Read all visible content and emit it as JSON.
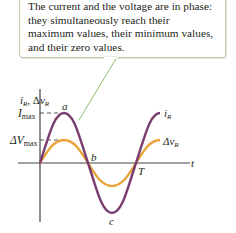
{
  "callout": {
    "lines": [
      "The current and the voltage are in phase:",
      "they simultaneously reach their",
      "maximum values, their minimum values,",
      "and their zero values."
    ]
  },
  "axes": {
    "y_label_i": "i",
    "y_label_i_sub": "R",
    "y_label_sep": ", Δ",
    "y_label_v": "v",
    "y_label_v_sub": "R",
    "x_label": "t"
  },
  "ticks": {
    "imax_main": "I",
    "imax_sub": "max",
    "vmax_main": "ΔV",
    "vmax_sub": "max"
  },
  "points": {
    "a": "a",
    "b": "b",
    "c": "c",
    "T": "T"
  },
  "legend": {
    "current_main": "i",
    "current_sub": "R",
    "voltage_main": "Δv",
    "voltage_sub": "R"
  },
  "colors": {
    "current": "#7a3b6e",
    "voltage": "#e8a33a",
    "callout_border": "#b9cfa8",
    "pointer": "#8cbf6a",
    "axis": "#444444"
  }
}
